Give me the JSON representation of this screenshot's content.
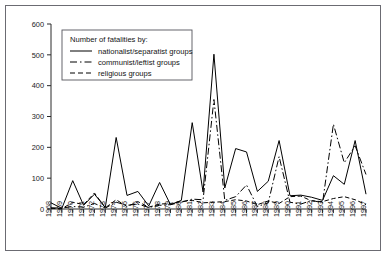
{
  "figure": {
    "background_color": "#ffffff",
    "frame_color": "#6b6b72",
    "ink_color": "#000000"
  },
  "legend": {
    "title": "Number of fatalities by:",
    "position": "top-left",
    "entries": [
      {
        "label": "nationalist/separatist groups",
        "dash": "solid"
      },
      {
        "label": "communist/leftist groups",
        "dash": "long-dash"
      },
      {
        "label": "religious groups",
        "dash": "short-dash"
      }
    ]
  },
  "axes": {
    "y_ticks": [
      "0",
      "100",
      "200",
      "300",
      "400",
      "500",
      "600"
    ],
    "x_ticks": [
      "1968",
      "1969",
      "1970",
      "1971",
      "1972",
      "1973",
      "1974",
      "1975",
      "1976",
      "1977",
      "1978",
      "1979",
      "1980",
      "1981",
      "1982",
      "1983",
      "1984",
      "1985",
      "1986",
      "1987",
      "1988",
      "1989",
      "1990",
      "1991",
      "1992",
      "1993",
      "1994",
      "1995",
      "1996",
      "1997"
    ]
  },
  "chart_data": {
    "type": "line",
    "title": "",
    "xlabel": "",
    "ylabel": "",
    "ylim": [
      0,
      600
    ],
    "grid": false,
    "legend_position": "top-left",
    "categories": [
      "1968",
      "1969",
      "1970",
      "1971",
      "1972",
      "1973",
      "1974",
      "1975",
      "1976",
      "1977",
      "1978",
      "1979",
      "1980",
      "1981",
      "1982",
      "1983",
      "1984",
      "1985",
      "1986",
      "1987",
      "1988",
      "1989",
      "1990",
      "1991",
      "1992",
      "1993",
      "1994",
      "1995",
      "1996",
      "1997"
    ],
    "series": [
      {
        "name": "nationalist/separatist groups",
        "dash": "solid",
        "values": [
          20,
          2,
          92,
          12,
          48,
          5,
          232,
          44,
          57,
          10,
          86,
          14,
          28,
          280,
          55,
          502,
          68,
          196,
          185,
          57,
          90,
          222,
          43,
          45,
          38,
          28,
          108,
          80,
          222,
          48
        ]
      },
      {
        "name": "communist/leftist groups",
        "dash": "long-dash",
        "values": [
          4,
          3,
          8,
          6,
          18,
          3,
          22,
          12,
          16,
          5,
          12,
          14,
          22,
          32,
          30,
          355,
          28,
          40,
          78,
          8,
          20,
          170,
          22,
          16,
          28,
          20,
          275,
          150,
          205,
          112
        ]
      },
      {
        "name": "religious groups",
        "dash": "short-dash",
        "values": [
          2,
          1,
          22,
          14,
          52,
          4,
          30,
          8,
          24,
          6,
          16,
          18,
          24,
          28,
          20,
          22,
          24,
          30,
          26,
          14,
          26,
          18,
          40,
          42,
          26,
          24,
          34,
          40,
          30,
          14
        ]
      }
    ]
  }
}
